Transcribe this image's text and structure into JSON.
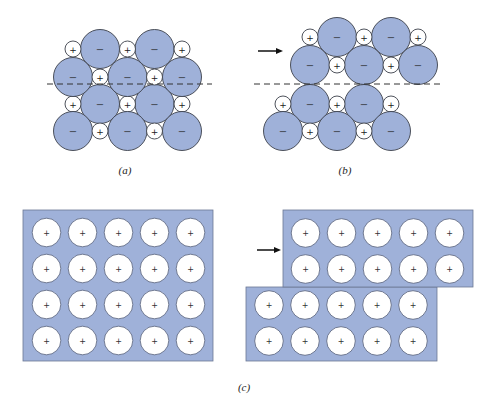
{
  "figure": {
    "panels": [
      {
        "id": "a",
        "label": "(a)",
        "anion_sign": "−",
        "cation_sign": "+",
        "has_arrow": false,
        "has_dashed_line": true
      },
      {
        "id": "b",
        "label": "(b)",
        "anion_sign": "−",
        "cation_sign": "+",
        "has_arrow": true,
        "has_dashed_line": true
      },
      {
        "id": "c",
        "label": "(c)",
        "cation_sign": "+",
        "left_slab": {
          "rows": 4,
          "cols": 5
        },
        "right_top_slab": {
          "rows": 2,
          "cols": 5
        },
        "right_bottom_slab": {
          "rows": 2,
          "cols": 5
        },
        "has_arrow": true
      }
    ],
    "colors": {
      "anion_fill": "#9fb1d9",
      "cation_fill": "#ffffff",
      "outline": "#3b3f4a",
      "slab_fill": "#9fb1d9"
    }
  }
}
